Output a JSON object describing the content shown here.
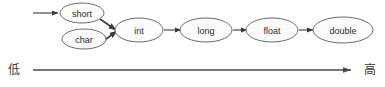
{
  "diagram": {
    "background_color": "#ffffff",
    "node_fill_color": "#fbfbfb",
    "node_stroke_color": "#6b6b6b",
    "edge_color": "#4a4a4a",
    "text_color": "#2b2b2b",
    "nodes": [
      {
        "id": "short",
        "label": "short",
        "cx": 82,
        "cy": 13,
        "rx": 22,
        "ry": 10
      },
      {
        "id": "char",
        "label": "char",
        "cx": 84,
        "cy": 39,
        "rx": 22,
        "ry": 10
      },
      {
        "id": "int",
        "label": "int",
        "cx": 139,
        "cy": 30,
        "rx": 24,
        "ry": 12
      },
      {
        "id": "long",
        "label": "long",
        "cx": 206,
        "cy": 30,
        "rx": 26,
        "ry": 12
      },
      {
        "id": "float",
        "label": "float",
        "cx": 272,
        "cy": 30,
        "rx": 26,
        "ry": 12
      },
      {
        "id": "double",
        "label": "double",
        "cx": 343,
        "cy": 30,
        "rx": 30,
        "ry": 13
      }
    ],
    "edges": [
      {
        "id": "entry-to-short",
        "from": "",
        "to": "short",
        "kind": "entry"
      },
      {
        "id": "short-to-int",
        "from": "short",
        "to": "int",
        "kind": "converge"
      },
      {
        "id": "char-to-int",
        "from": "char",
        "to": "int",
        "kind": "converge"
      },
      {
        "id": "int-to-long",
        "from": "int",
        "to": "long",
        "kind": "straight"
      },
      {
        "id": "long-to-float",
        "from": "long",
        "to": "float",
        "kind": "straight"
      },
      {
        "id": "float-to-double",
        "from": "float",
        "to": "double",
        "kind": "straight"
      }
    ],
    "axis": {
      "left_label": "低",
      "right_label": "高",
      "line_y": 70,
      "line_x_start": 33,
      "line_x_end": 351,
      "direction": "left-to-right"
    }
  }
}
